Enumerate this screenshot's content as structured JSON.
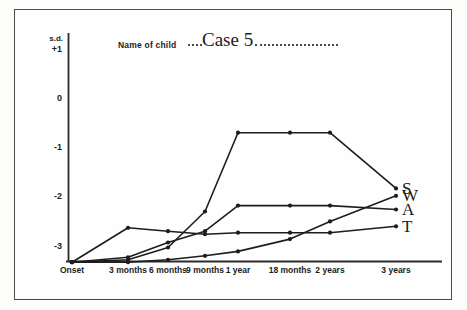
{
  "form": {
    "name_of_child_label": "Name of child",
    "case_name": "Case 5"
  },
  "chart_data": {
    "type": "line",
    "title": "Case 5",
    "xlabel": "",
    "ylabel": "s.d.",
    "y_axis_unit": "s.d.",
    "categories": [
      "Onset",
      "3 months",
      "6 months",
      "9 months",
      "1 year",
      "18 months",
      "2 years",
      "3 years"
    ],
    "yticks": [
      "+1",
      "0",
      "-1",
      "-2",
      "-3"
    ],
    "ytick_values": [
      1,
      0,
      -1,
      -2,
      -3
    ],
    "ylim": [
      -3.45,
      1.35
    ],
    "grid": false,
    "legend_position": "right-inline",
    "series": [
      {
        "name": "S",
        "label": "S",
        "values": [
          -3.35,
          -3.3,
          -3.05,
          -2.32,
          -0.72,
          -0.72,
          -0.72,
          -1.85
        ]
      },
      {
        "name": "W",
        "label": "W",
        "values": [
          -3.35,
          -3.35,
          -3.3,
          -3.22,
          -3.13,
          -2.88,
          -2.52,
          -2.0
        ]
      },
      {
        "name": "A",
        "label": "A",
        "values": [
          -3.35,
          -3.25,
          -2.95,
          -2.72,
          -2.2,
          -2.2,
          -2.2,
          -2.28
        ]
      },
      {
        "name": "T",
        "label": "T",
        "values": [
          -3.35,
          -2.65,
          -2.72,
          -2.78,
          -2.75,
          -2.75,
          -2.75,
          -2.62
        ]
      }
    ]
  },
  "labels": {
    "sd": "s.d."
  }
}
